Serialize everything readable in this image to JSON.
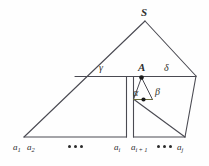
{
  "figure": {
    "kind": "parse-tree-diagram",
    "background_color": "#fefefe",
    "line_color": "#4a4a52",
    "accent_line_color": "#6b6b3a",
    "node_dot_color": "#1a1a1a",
    "labels": {
      "root": "S",
      "inner_root": "A",
      "angle_left": "γ",
      "angle_right": "δ",
      "angle_inner_left": "α",
      "angle_inner_right": "β"
    },
    "terminals": [
      {
        "name": "a-1",
        "text": "a",
        "sub": "1"
      },
      {
        "name": "a-2",
        "text": "a",
        "sub": "2"
      },
      {
        "name": "a-i",
        "text": "a",
        "sub": "i"
      },
      {
        "name": "a-i-plus-1",
        "text": "a",
        "sub": "i + 1"
      },
      {
        "name": "a-j",
        "text": "a",
        "sub": "j"
      }
    ],
    "ellipses": [
      {
        "name": "ellipsis-left",
        "dots": 3
      },
      {
        "name": "ellipsis-right",
        "dots": 3
      }
    ]
  }
}
